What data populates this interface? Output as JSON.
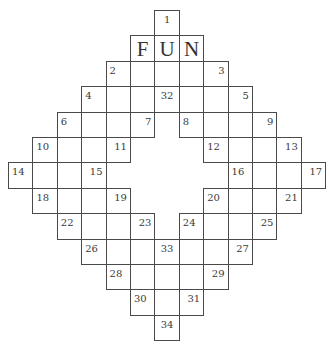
{
  "puzzle": {
    "grid": {
      "origin_x": 8,
      "origin_y": 10,
      "cell_w": 24.4,
      "cell_h": 25.4,
      "rows": 13,
      "cols": 13
    },
    "cells": [
      {
        "r": 0,
        "c": 6,
        "num": "1",
        "align": "center",
        "letter": ""
      },
      {
        "r": 1,
        "c": 5,
        "num": "",
        "align": "left",
        "letter": "F"
      },
      {
        "r": 1,
        "c": 6,
        "num": "",
        "align": "left",
        "letter": "U"
      },
      {
        "r": 1,
        "c": 7,
        "num": "",
        "align": "left",
        "letter": "N"
      },
      {
        "r": 2,
        "c": 4,
        "num": "2",
        "align": "left",
        "letter": ""
      },
      {
        "r": 2,
        "c": 5,
        "num": "",
        "align": "left",
        "letter": ""
      },
      {
        "r": 2,
        "c": 6,
        "num": "",
        "align": "left",
        "letter": ""
      },
      {
        "r": 2,
        "c": 7,
        "num": "",
        "align": "left",
        "letter": ""
      },
      {
        "r": 2,
        "c": 8,
        "num": "3",
        "align": "right",
        "letter": ""
      },
      {
        "r": 3,
        "c": 3,
        "num": "4",
        "align": "left",
        "letter": ""
      },
      {
        "r": 3,
        "c": 4,
        "num": "",
        "align": "left",
        "letter": ""
      },
      {
        "r": 3,
        "c": 5,
        "num": "",
        "align": "left",
        "letter": ""
      },
      {
        "r": 3,
        "c": 6,
        "num": "32",
        "align": "center",
        "letter": ""
      },
      {
        "r": 3,
        "c": 7,
        "num": "",
        "align": "left",
        "letter": ""
      },
      {
        "r": 3,
        "c": 8,
        "num": "",
        "align": "left",
        "letter": ""
      },
      {
        "r": 3,
        "c": 9,
        "num": "5",
        "align": "right",
        "letter": ""
      },
      {
        "r": 4,
        "c": 2,
        "num": "6",
        "align": "left",
        "letter": ""
      },
      {
        "r": 4,
        "c": 3,
        "num": "",
        "align": "left",
        "letter": ""
      },
      {
        "r": 4,
        "c": 4,
        "num": "",
        "align": "left",
        "letter": ""
      },
      {
        "r": 4,
        "c": 5,
        "num": "7",
        "align": "right",
        "letter": ""
      },
      {
        "r": 4,
        "c": 7,
        "num": "8",
        "align": "left",
        "letter": ""
      },
      {
        "r": 4,
        "c": 8,
        "num": "",
        "align": "left",
        "letter": ""
      },
      {
        "r": 4,
        "c": 9,
        "num": "",
        "align": "left",
        "letter": ""
      },
      {
        "r": 4,
        "c": 10,
        "num": "9",
        "align": "right",
        "letter": ""
      },
      {
        "r": 5,
        "c": 1,
        "num": "10",
        "align": "left",
        "letter": ""
      },
      {
        "r": 5,
        "c": 2,
        "num": "",
        "align": "left",
        "letter": ""
      },
      {
        "r": 5,
        "c": 3,
        "num": "",
        "align": "left",
        "letter": ""
      },
      {
        "r": 5,
        "c": 4,
        "num": "11",
        "align": "right",
        "letter": ""
      },
      {
        "r": 5,
        "c": 8,
        "num": "12",
        "align": "left",
        "letter": ""
      },
      {
        "r": 5,
        "c": 9,
        "num": "",
        "align": "left",
        "letter": ""
      },
      {
        "r": 5,
        "c": 10,
        "num": "",
        "align": "left",
        "letter": ""
      },
      {
        "r": 5,
        "c": 11,
        "num": "13",
        "align": "right",
        "letter": ""
      },
      {
        "r": 6,
        "c": 0,
        "num": "14",
        "align": "left",
        "letter": ""
      },
      {
        "r": 6,
        "c": 1,
        "num": "",
        "align": "left",
        "letter": ""
      },
      {
        "r": 6,
        "c": 2,
        "num": "",
        "align": "left",
        "letter": ""
      },
      {
        "r": 6,
        "c": 3,
        "num": "15",
        "align": "right",
        "letter": ""
      },
      {
        "r": 6,
        "c": 9,
        "num": "16",
        "align": "left",
        "letter": ""
      },
      {
        "r": 6,
        "c": 10,
        "num": "",
        "align": "left",
        "letter": ""
      },
      {
        "r": 6,
        "c": 11,
        "num": "",
        "align": "left",
        "letter": ""
      },
      {
        "r": 6,
        "c": 12,
        "num": "17",
        "align": "right",
        "letter": ""
      },
      {
        "r": 7,
        "c": 1,
        "num": "18",
        "align": "left",
        "letter": ""
      },
      {
        "r": 7,
        "c": 2,
        "num": "",
        "align": "left",
        "letter": ""
      },
      {
        "r": 7,
        "c": 3,
        "num": "",
        "align": "left",
        "letter": ""
      },
      {
        "r": 7,
        "c": 4,
        "num": "19",
        "align": "right",
        "letter": ""
      },
      {
        "r": 7,
        "c": 8,
        "num": "20",
        "align": "left",
        "letter": ""
      },
      {
        "r": 7,
        "c": 9,
        "num": "",
        "align": "left",
        "letter": ""
      },
      {
        "r": 7,
        "c": 10,
        "num": "",
        "align": "left",
        "letter": ""
      },
      {
        "r": 7,
        "c": 11,
        "num": "21",
        "align": "right",
        "letter": ""
      },
      {
        "r": 8,
        "c": 2,
        "num": "22",
        "align": "left",
        "letter": ""
      },
      {
        "r": 8,
        "c": 3,
        "num": "",
        "align": "left",
        "letter": ""
      },
      {
        "r": 8,
        "c": 4,
        "num": "",
        "align": "left",
        "letter": ""
      },
      {
        "r": 8,
        "c": 5,
        "num": "23",
        "align": "right",
        "letter": ""
      },
      {
        "r": 8,
        "c": 7,
        "num": "24",
        "align": "left",
        "letter": ""
      },
      {
        "r": 8,
        "c": 8,
        "num": "",
        "align": "left",
        "letter": ""
      },
      {
        "r": 8,
        "c": 9,
        "num": "",
        "align": "left",
        "letter": ""
      },
      {
        "r": 8,
        "c": 10,
        "num": "25",
        "align": "right",
        "letter": ""
      },
      {
        "r": 9,
        "c": 3,
        "num": "26",
        "align": "left",
        "letter": ""
      },
      {
        "r": 9,
        "c": 4,
        "num": "",
        "align": "left",
        "letter": ""
      },
      {
        "r": 9,
        "c": 5,
        "num": "",
        "align": "left",
        "letter": ""
      },
      {
        "r": 9,
        "c": 6,
        "num": "33",
        "align": "center",
        "letter": ""
      },
      {
        "r": 9,
        "c": 7,
        "num": "",
        "align": "left",
        "letter": ""
      },
      {
        "r": 9,
        "c": 8,
        "num": "",
        "align": "left",
        "letter": ""
      },
      {
        "r": 9,
        "c": 9,
        "num": "27",
        "align": "right",
        "letter": ""
      },
      {
        "r": 10,
        "c": 4,
        "num": "28",
        "align": "left",
        "letter": ""
      },
      {
        "r": 10,
        "c": 5,
        "num": "",
        "align": "left",
        "letter": ""
      },
      {
        "r": 10,
        "c": 6,
        "num": "",
        "align": "left",
        "letter": ""
      },
      {
        "r": 10,
        "c": 7,
        "num": "",
        "align": "left",
        "letter": ""
      },
      {
        "r": 10,
        "c": 8,
        "num": "29",
        "align": "right",
        "letter": ""
      },
      {
        "r": 11,
        "c": 5,
        "num": "30",
        "align": "left",
        "letter": ""
      },
      {
        "r": 11,
        "c": 6,
        "num": "",
        "align": "left",
        "letter": ""
      },
      {
        "r": 11,
        "c": 7,
        "num": "31",
        "align": "right",
        "letter": ""
      },
      {
        "r": 12,
        "c": 6,
        "num": "34",
        "align": "center",
        "letter": ""
      }
    ]
  },
  "colors": {
    "grid_line": "#4a4a4a",
    "text": "#333333",
    "background": "#ffffff"
  }
}
